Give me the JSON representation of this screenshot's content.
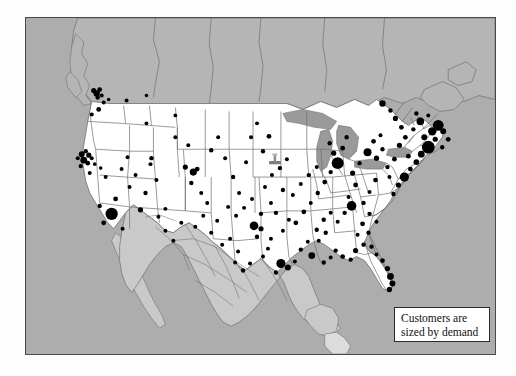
{
  "figure": {
    "type": "dot-density-map",
    "region": "United States with Canada and Mexico",
    "frame": {
      "x": 25,
      "y": 17,
      "width": 471,
      "height": 338
    }
  },
  "legend": {
    "line1": "Customers are",
    "line2": "sized by demand",
    "box": {
      "x": 368,
      "y": 289,
      "width": 96,
      "height": 35
    }
  },
  "colors": {
    "ocean": "#adadad",
    "canada": "#b5b5b5",
    "mexico": "#c9c9c9",
    "usa": "#ffffff",
    "lakes": "#9a9a9a",
    "border_line": "#4a4a4a",
    "state_line": "#6f6f6f",
    "dot": "#000000",
    "legend_bg": "#ffffff",
    "legend_border": "#2b2b2b",
    "page_bg": "#fdfdfd"
  },
  "marker": {
    "name": "location-pin",
    "x": 249,
    "y": 141,
    "color": "#7d7d7d"
  },
  "chart_data": {
    "type": "scatter",
    "title": "Customers are sized by demand",
    "xlabel": "",
    "ylabel": "",
    "encoding": "marker area proportional to customer demand",
    "points": [
      {
        "x": 68,
        "y": 73,
        "r": 2.6
      },
      {
        "x": 71,
        "y": 76,
        "r": 3.2
      },
      {
        "x": 74,
        "y": 72,
        "r": 2.4
      },
      {
        "x": 76,
        "y": 78,
        "r": 2.0
      },
      {
        "x": 72,
        "y": 80,
        "r": 2.2
      },
      {
        "x": 78,
        "y": 85,
        "r": 2.0
      },
      {
        "x": 83,
        "y": 82,
        "r": 1.8
      },
      {
        "x": 73,
        "y": 92,
        "r": 2.4
      },
      {
        "x": 66,
        "y": 97,
        "r": 2.0
      },
      {
        "x": 101,
        "y": 83,
        "r": 2.0
      },
      {
        "x": 121,
        "y": 78,
        "r": 1.8
      },
      {
        "x": 150,
        "y": 98,
        "r": 1.9
      },
      {
        "x": 121,
        "y": 106,
        "r": 1.9
      },
      {
        "x": 52,
        "y": 141,
        "r": 2.0
      },
      {
        "x": 56,
        "y": 137,
        "r": 3.0
      },
      {
        "x": 60,
        "y": 134,
        "r": 2.2
      },
      {
        "x": 63,
        "y": 138,
        "r": 2.6
      },
      {
        "x": 58,
        "y": 143,
        "r": 3.4
      },
      {
        "x": 62,
        "y": 146,
        "r": 2.4
      },
      {
        "x": 55,
        "y": 149,
        "r": 2.2
      },
      {
        "x": 66,
        "y": 141,
        "r": 2.0
      },
      {
        "x": 69,
        "y": 147,
        "r": 1.8
      },
      {
        "x": 64,
        "y": 156,
        "r": 2.0
      },
      {
        "x": 75,
        "y": 151,
        "r": 1.8
      },
      {
        "x": 80,
        "y": 160,
        "r": 2.0
      },
      {
        "x": 86,
        "y": 197,
        "r": 6.2
      },
      {
        "x": 78,
        "y": 206,
        "r": 2.4
      },
      {
        "x": 74,
        "y": 189,
        "r": 2.2
      },
      {
        "x": 90,
        "y": 182,
        "r": 2.4
      },
      {
        "x": 104,
        "y": 170,
        "r": 2.0
      },
      {
        "x": 97,
        "y": 212,
        "r": 2.0
      },
      {
        "x": 115,
        "y": 193,
        "r": 2.6
      },
      {
        "x": 126,
        "y": 141,
        "r": 2.2
      },
      {
        "x": 125,
        "y": 147,
        "r": 2.0
      },
      {
        "x": 131,
        "y": 163,
        "r": 2.0
      },
      {
        "x": 120,
        "y": 176,
        "r": 2.2
      },
      {
        "x": 140,
        "y": 192,
        "r": 2.0
      },
      {
        "x": 160,
        "y": 150,
        "r": 2.6
      },
      {
        "x": 168,
        "y": 155,
        "r": 3.6
      },
      {
        "x": 172,
        "y": 152,
        "r": 2.4
      },
      {
        "x": 166,
        "y": 166,
        "r": 2.2
      },
      {
        "x": 176,
        "y": 176,
        "r": 2.0
      },
      {
        "x": 182,
        "y": 186,
        "r": 2.0
      },
      {
        "x": 150,
        "y": 120,
        "r": 2.0
      },
      {
        "x": 163,
        "y": 128,
        "r": 2.0
      },
      {
        "x": 186,
        "y": 133,
        "r": 2.2
      },
      {
        "x": 193,
        "y": 120,
        "r": 2.0
      },
      {
        "x": 200,
        "y": 141,
        "r": 2.0
      },
      {
        "x": 208,
        "y": 160,
        "r": 2.2
      },
      {
        "x": 214,
        "y": 176,
        "r": 2.0
      },
      {
        "x": 221,
        "y": 145,
        "r": 2.0
      },
      {
        "x": 226,
        "y": 120,
        "r": 2.0
      },
      {
        "x": 232,
        "y": 106,
        "r": 2.0
      },
      {
        "x": 238,
        "y": 134,
        "r": 2.2
      },
      {
        "x": 244,
        "y": 119,
        "r": 2.4
      },
      {
        "x": 247,
        "y": 158,
        "r": 2.0
      },
      {
        "x": 255,
        "y": 151,
        "r": 2.2
      },
      {
        "x": 262,
        "y": 142,
        "r": 2.0
      },
      {
        "x": 258,
        "y": 173,
        "r": 2.2
      },
      {
        "x": 246,
        "y": 186,
        "r": 2.0
      },
      {
        "x": 236,
        "y": 197,
        "r": 2.2
      },
      {
        "x": 229,
        "y": 209,
        "r": 4.4
      },
      {
        "x": 236,
        "y": 212,
        "r": 2.6
      },
      {
        "x": 232,
        "y": 220,
        "r": 2.2
      },
      {
        "x": 243,
        "y": 232,
        "r": 2.0
      },
      {
        "x": 256,
        "y": 247,
        "r": 4.6
      },
      {
        "x": 263,
        "y": 251,
        "r": 3.0
      },
      {
        "x": 251,
        "y": 256,
        "r": 2.2
      },
      {
        "x": 270,
        "y": 245,
        "r": 2.0
      },
      {
        "x": 225,
        "y": 247,
        "r": 2.0
      },
      {
        "x": 213,
        "y": 235,
        "r": 2.0
      },
      {
        "x": 205,
        "y": 222,
        "r": 2.0
      },
      {
        "x": 276,
        "y": 233,
        "r": 2.2
      },
      {
        "x": 287,
        "y": 239,
        "r": 3.4
      },
      {
        "x": 283,
        "y": 225,
        "r": 2.0
      },
      {
        "x": 292,
        "y": 213,
        "r": 2.2
      },
      {
        "x": 299,
        "y": 246,
        "r": 2.2
      },
      {
        "x": 306,
        "y": 241,
        "r": 2.0
      },
      {
        "x": 271,
        "y": 206,
        "r": 2.4
      },
      {
        "x": 279,
        "y": 195,
        "r": 2.4
      },
      {
        "x": 286,
        "y": 186,
        "r": 2.0
      },
      {
        "x": 293,
        "y": 176,
        "r": 2.2
      },
      {
        "x": 300,
        "y": 165,
        "r": 2.4
      },
      {
        "x": 306,
        "y": 155,
        "r": 2.2
      },
      {
        "x": 292,
        "y": 150,
        "r": 2.0
      },
      {
        "x": 284,
        "y": 158,
        "r": 2.2
      },
      {
        "x": 276,
        "y": 167,
        "r": 2.0
      },
      {
        "x": 268,
        "y": 178,
        "r": 2.0
      },
      {
        "x": 313,
        "y": 146,
        "r": 6.0
      },
      {
        "x": 309,
        "y": 136,
        "r": 2.6
      },
      {
        "x": 318,
        "y": 131,
        "r": 2.4
      },
      {
        "x": 305,
        "y": 126,
        "r": 2.2
      },
      {
        "x": 322,
        "y": 120,
        "r": 2.2
      },
      {
        "x": 328,
        "y": 156,
        "r": 2.6
      },
      {
        "x": 335,
        "y": 146,
        "r": 2.2
      },
      {
        "x": 331,
        "y": 168,
        "r": 2.4
      },
      {
        "x": 324,
        "y": 180,
        "r": 2.0
      },
      {
        "x": 339,
        "y": 186,
        "r": 2.2
      },
      {
        "x": 345,
        "y": 175,
        "r": 2.0
      },
      {
        "x": 351,
        "y": 163,
        "r": 2.4
      },
      {
        "x": 343,
        "y": 135,
        "r": 4.0
      },
      {
        "x": 352,
        "y": 141,
        "r": 2.6
      },
      {
        "x": 358,
        "y": 132,
        "r": 2.2
      },
      {
        "x": 349,
        "y": 124,
        "r": 2.4
      },
      {
        "x": 356,
        "y": 118,
        "r": 2.0
      },
      {
        "x": 363,
        "y": 150,
        "r": 2.2
      },
      {
        "x": 370,
        "y": 142,
        "r": 2.4
      },
      {
        "x": 365,
        "y": 160,
        "r": 2.0
      },
      {
        "x": 375,
        "y": 128,
        "r": 2.6
      },
      {
        "x": 381,
        "y": 120,
        "r": 2.4
      },
      {
        "x": 389,
        "y": 112,
        "r": 2.2
      },
      {
        "x": 396,
        "y": 104,
        "r": 3.8
      },
      {
        "x": 392,
        "y": 96,
        "r": 2.2
      },
      {
        "x": 404,
        "y": 98,
        "r": 2.0
      },
      {
        "x": 400,
        "y": 120,
        "r": 3.0
      },
      {
        "x": 408,
        "y": 114,
        "r": 4.2
      },
      {
        "x": 414,
        "y": 108,
        "r": 5.4
      },
      {
        "x": 419,
        "y": 114,
        "r": 3.0
      },
      {
        "x": 411,
        "y": 122,
        "r": 2.6
      },
      {
        "x": 404,
        "y": 130,
        "r": 6.4
      },
      {
        "x": 397,
        "y": 137,
        "r": 3.4
      },
      {
        "x": 392,
        "y": 145,
        "r": 2.8
      },
      {
        "x": 386,
        "y": 152,
        "r": 2.4
      },
      {
        "x": 380,
        "y": 160,
        "r": 4.6
      },
      {
        "x": 374,
        "y": 168,
        "r": 2.6
      },
      {
        "x": 369,
        "y": 177,
        "r": 2.2
      },
      {
        "x": 384,
        "y": 139,
        "r": 2.4
      },
      {
        "x": 377,
        "y": 110,
        "r": 2.4
      },
      {
        "x": 371,
        "y": 101,
        "r": 2.6
      },
      {
        "x": 366,
        "y": 93,
        "r": 2.2
      },
      {
        "x": 358,
        "y": 86,
        "r": 3.2
      },
      {
        "x": 424,
        "y": 122,
        "r": 2.4
      },
      {
        "x": 418,
        "y": 130,
        "r": 2.2
      },
      {
        "x": 345,
        "y": 197,
        "r": 2.2
      },
      {
        "x": 352,
        "y": 205,
        "r": 2.0
      },
      {
        "x": 338,
        "y": 207,
        "r": 2.4
      },
      {
        "x": 344,
        "y": 216,
        "r": 2.2
      },
      {
        "x": 333,
        "y": 218,
        "r": 2.0
      },
      {
        "x": 339,
        "y": 228,
        "r": 2.2
      },
      {
        "x": 331,
        "y": 234,
        "r": 2.6
      },
      {
        "x": 326,
        "y": 243,
        "r": 2.2
      },
      {
        "x": 318,
        "y": 240,
        "r": 2.4
      },
      {
        "x": 311,
        "y": 234,
        "r": 2.2
      },
      {
        "x": 347,
        "y": 230,
        "r": 2.2
      },
      {
        "x": 352,
        "y": 238,
        "r": 2.0
      },
      {
        "x": 358,
        "y": 244,
        "r": 2.4
      },
      {
        "x": 363,
        "y": 252,
        "r": 2.6
      },
      {
        "x": 366,
        "y": 260,
        "r": 3.4
      },
      {
        "x": 368,
        "y": 267,
        "r": 3.0
      },
      {
        "x": 365,
        "y": 273,
        "r": 2.6
      },
      {
        "x": 306,
        "y": 196,
        "r": 2.0
      },
      {
        "x": 299,
        "y": 203,
        "r": 2.2
      },
      {
        "x": 313,
        "y": 205,
        "r": 2.0
      },
      {
        "x": 320,
        "y": 196,
        "r": 2.2
      },
      {
        "x": 327,
        "y": 189,
        "r": 4.8
      },
      {
        "x": 294,
        "y": 224,
        "r": 2.0
      },
      {
        "x": 301,
        "y": 216,
        "r": 2.2
      },
      {
        "x": 192,
        "y": 204,
        "r": 2.0
      },
      {
        "x": 186,
        "y": 216,
        "r": 2.0
      },
      {
        "x": 197,
        "y": 228,
        "r": 2.0
      },
      {
        "x": 178,
        "y": 199,
        "r": 2.0
      },
      {
        "x": 170,
        "y": 210,
        "r": 2.0
      },
      {
        "x": 203,
        "y": 190,
        "r": 2.0
      },
      {
        "x": 211,
        "y": 199,
        "r": 2.0
      },
      {
        "x": 219,
        "y": 191,
        "r": 2.0
      },
      {
        "x": 227,
        "y": 182,
        "r": 2.0
      },
      {
        "x": 240,
        "y": 170,
        "r": 2.0
      },
      {
        "x": 251,
        "y": 196,
        "r": 2.2
      },
      {
        "x": 264,
        "y": 203,
        "r": 2.0
      },
      {
        "x": 258,
        "y": 214,
        "r": 2.0
      },
      {
        "x": 246,
        "y": 222,
        "r": 2.0
      },
      {
        "x": 238,
        "y": 240,
        "r": 2.0
      },
      {
        "x": 218,
        "y": 254,
        "r": 2.2
      },
      {
        "x": 210,
        "y": 246,
        "r": 2.0
      },
      {
        "x": 140,
        "y": 214,
        "r": 2.0
      },
      {
        "x": 148,
        "y": 224,
        "r": 2.0
      },
      {
        "x": 156,
        "y": 206,
        "r": 2.0
      },
      {
        "x": 133,
        "y": 200,
        "r": 2.0
      },
      {
        "x": 110,
        "y": 158,
        "r": 2.0
      },
      {
        "x": 96,
        "y": 152,
        "r": 2.0
      },
      {
        "x": 102,
        "y": 140,
        "r": 2.0
      }
    ]
  }
}
